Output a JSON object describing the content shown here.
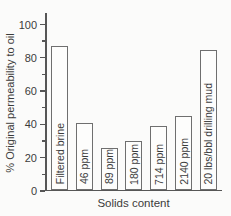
{
  "chart_data": {
    "type": "bar",
    "title": "",
    "xlabel": "Solids content",
    "ylabel": "% Original permeability to oil",
    "categories": [
      "Filtered brine",
      "46 ppm",
      "89 ppm",
      "180 ppm",
      "714 ppm",
      "2140 ppm",
      "20 lbs/bbl drilling mud"
    ],
    "values": [
      86,
      40,
      25,
      29,
      38,
      44,
      84
    ],
    "ylim": [
      0,
      107
    ],
    "yticks_major": [
      0,
      20,
      40,
      60,
      80,
      100
    ],
    "yticks_minor": [
      10,
      30,
      50,
      70,
      90
    ],
    "grid": false,
    "legend": false,
    "bar_labels_inside": true,
    "colors": {
      "background": "#fbfbfa",
      "bar_fill": "#fdfdfc",
      "bar_border": "#6f6f6f",
      "axis": "#565656",
      "text": "#3b3b3b"
    }
  }
}
